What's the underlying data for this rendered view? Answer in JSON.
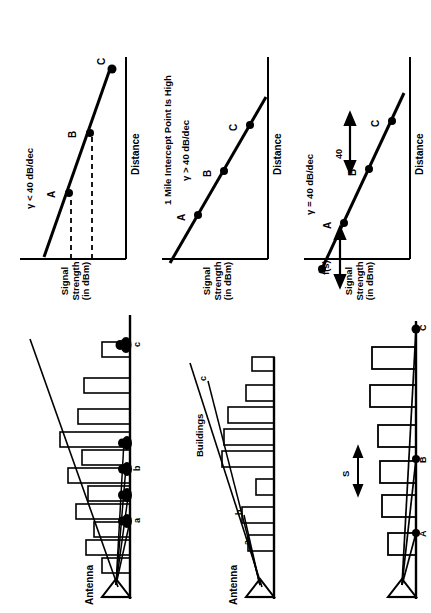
{
  "figure": {
    "orientation": "rotated-90-ccw",
    "ink_color": "#000000",
    "background": "#ffffff"
  },
  "plots": [
    {
      "id": "plot-top",
      "ylabel": "Signal\nStrength\n(in dBm)",
      "ylabel_lines": [
        "Signal",
        "Strength",
        "(in dBm)"
      ],
      "xlabel": "Distance",
      "annotation": "γ < 40 dB/dec",
      "points": [
        {
          "label": "A"
        },
        {
          "label": "B"
        },
        {
          "label": "C"
        }
      ],
      "dashed_guides": true
    },
    {
      "id": "plot-middle",
      "ylabel_lines": [
        "Signal",
        "Strength",
        "(in dBm)"
      ],
      "xlabel": "Distance",
      "annotation_top": "1 Mile Intercept Point Is High",
      "annotation": "γ > 40 dB/dec",
      "points": [
        {
          "label": "A"
        },
        {
          "label": "B"
        },
        {
          "label": "C"
        }
      ],
      "dashed_guides": false
    },
    {
      "id": "plot-bottom",
      "ylabel_lines": [
        "Signal",
        "Strength",
        "(in dBm)"
      ],
      "xlabel": "Distance",
      "annotation": "γ = 40 dB/dec",
      "slope_value": "40",
      "intercept_label": "f(s)",
      "points": [
        {
          "label": "A"
        },
        {
          "label": "B"
        },
        {
          "label": "C"
        }
      ],
      "arrows": [
        "intercept-double-arrow",
        "upper-double-arrow"
      ]
    }
  ],
  "scenes": [
    {
      "id": "scene-top",
      "antenna_label": "Antenna",
      "ray_labels": [
        "a",
        "b",
        "c"
      ],
      "has_foliage": true,
      "buildings_label": ""
    },
    {
      "id": "scene-middle",
      "antenna_label": "Antenna",
      "buildings_label": "Buildings",
      "ray_labels": [
        "a",
        "b",
        "c"
      ],
      "has_foliage": false
    },
    {
      "id": "scene-bottom",
      "antenna_label": "",
      "buildings_label": "",
      "ray_labels": [
        "A",
        "B",
        "C"
      ],
      "spacing_label": "S",
      "has_foliage": false
    }
  ]
}
